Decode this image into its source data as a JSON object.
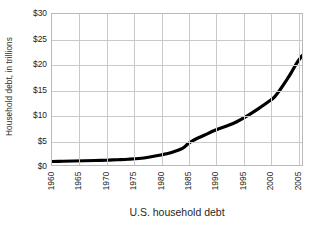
{
  "chart_data": {
    "type": "line",
    "title": "",
    "xlabel": "U.S. household debt",
    "ylabel": "Household debt, in trillions",
    "xlim": [
      1960,
      2006
    ],
    "ylim": [
      0,
      30
    ],
    "grid": true,
    "legend": "none",
    "y_tick_labels": [
      "$30",
      "$25",
      "$20",
      "$15",
      "$10",
      "$5",
      "$0"
    ],
    "y_ticks": [
      30,
      25,
      20,
      15,
      10,
      5,
      0
    ],
    "x_tick_labels": [
      "1960",
      "1965",
      "1970",
      "1975",
      "1980",
      "1985",
      "1990",
      "1995",
      "2000",
      "2005"
    ],
    "x_ticks": [
      1960,
      1965,
      1970,
      1975,
      1980,
      1985,
      1990,
      1995,
      2000,
      2005
    ],
    "series": [
      {
        "name": "U.S. household debt",
        "color": "#000000",
        "line_width": 3.2,
        "x": [
          1960,
          1962,
          1964,
          1966,
          1968,
          1970,
          1972,
          1974,
          1976,
          1978,
          1980,
          1982,
          1984,
          1985,
          1986,
          1988,
          1990,
          1992,
          1994,
          1996,
          1998,
          2000,
          2001,
          2002,
          2003,
          2004,
          2005,
          2006
        ],
        "values": [
          0.7,
          0.75,
          0.8,
          0.85,
          0.9,
          0.95,
          1.05,
          1.15,
          1.3,
          1.6,
          2.0,
          2.5,
          3.3,
          4.2,
          4.9,
          5.9,
          6.9,
          7.7,
          8.6,
          9.8,
          11.2,
          12.7,
          13.6,
          15.0,
          16.6,
          18.3,
          20.2,
          21.7
        ]
      }
    ]
  },
  "axis": {
    "y_title": "Household debt, in trillions",
    "x_title": "U.S. household debt"
  }
}
